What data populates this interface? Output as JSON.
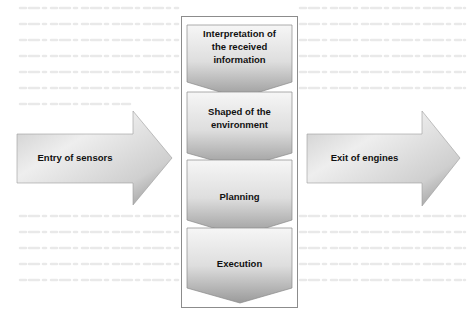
{
  "diagram": {
    "input_arrow": {
      "label": "Entry of sensors"
    },
    "output_arrow": {
      "label": "Exit of engines"
    },
    "steps": [
      {
        "label": "Interpretation of\nthe received\ninformation"
      },
      {
        "label": "Shaped of the\nenvironment"
      },
      {
        "label": "Planning"
      },
      {
        "label": "Execution"
      }
    ]
  },
  "colors": {
    "arrow_light": "#f2f2f2",
    "arrow_dark": "#8a8a8a",
    "frame_border": "#8c8c8c",
    "text": "#111111"
  }
}
